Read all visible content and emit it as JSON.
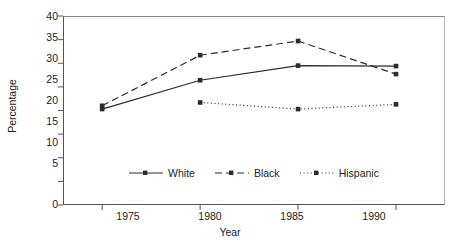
{
  "chart_data": {
    "type": "line",
    "title": "",
    "xlabel": "Year",
    "ylabel": "Percentage",
    "x": [
      1975,
      1980,
      1985,
      1990
    ],
    "categories": [
      "1975",
      "1980",
      "1985",
      "1990"
    ],
    "xlim": [
      1973,
      1992.5
    ],
    "ylim": [
      0,
      40
    ],
    "yticks": [
      0,
      5,
      10,
      15,
      20,
      25,
      30,
      35,
      40
    ],
    "ytick_labels": [
      "0",
      "5",
      "10",
      "15",
      "20",
      "25",
      "30",
      "35",
      "40"
    ],
    "xticks": [
      1975,
      1980,
      1985,
      1990
    ],
    "xtick_labels": [
      "1975",
      "1980",
      "1985",
      "1990"
    ],
    "grid": false,
    "legend_position": "inside-bottom-center",
    "series": [
      {
        "name": "White",
        "line_style": "solid",
        "marker": "square",
        "color": "#2b2b2b",
        "values": [
          20.3,
          26.4,
          29.5,
          29.4
        ]
      },
      {
        "name": "Black",
        "line_style": "dashed",
        "marker": "square",
        "color": "#2b2b2b",
        "values": [
          21.0,
          31.7,
          34.7,
          27.7
        ]
      },
      {
        "name": "Hispanic",
        "line_style": "dotted",
        "marker": "square",
        "color": "#2b2b2b",
        "values": [
          null,
          21.7,
          20.3,
          21.3
        ]
      }
    ]
  },
  "axes": {
    "y_title": "Percentage",
    "x_title": "Year",
    "y_labels": [
      "40",
      "35",
      "30",
      "25",
      "20",
      "15",
      "10",
      "5",
      "0"
    ],
    "x_labels": [
      "1975",
      "1980",
      "1985",
      "1990"
    ]
  },
  "legend": {
    "items": [
      {
        "label": "White",
        "style": "solid"
      },
      {
        "label": "Black",
        "style": "dashed"
      },
      {
        "label": "Hispanic",
        "style": "dotted"
      }
    ]
  },
  "title_sliver": {
    "text": "· ·  ·· ·   ·  ··"
  },
  "colors": {
    "ink": "#2b2b2b",
    "axis": "#555555",
    "frame_light": "#b9b9b9",
    "background": "#ffffff"
  }
}
